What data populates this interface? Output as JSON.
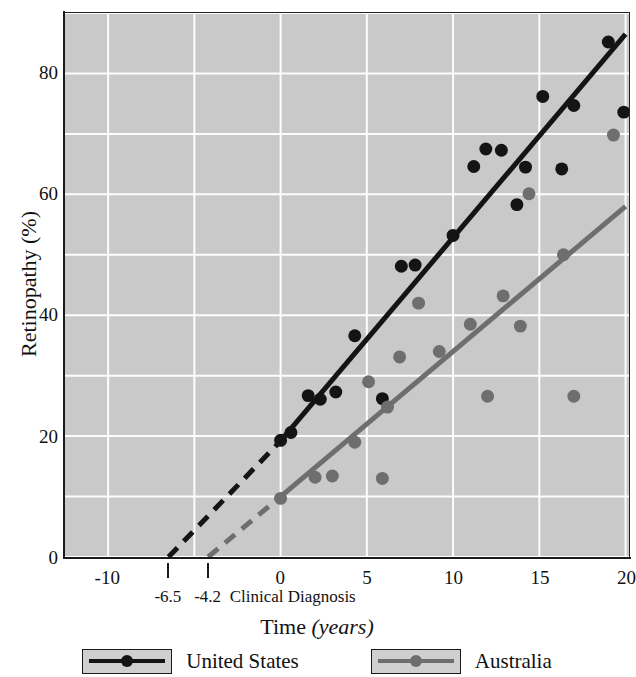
{
  "chart_data": {
    "type": "scatter",
    "title": "",
    "xlabel": "Time (years)",
    "xlabel_main": "Time",
    "xlabel_unit": "(years)",
    "ylabel": "Retinopathy (%)",
    "xlim": [
      -12.5,
      20.2
    ],
    "ylim": [
      0,
      90
    ],
    "grid": true,
    "grid_x_step": 5,
    "grid_y_step": 10,
    "plot_background": "#c9c9c9",
    "x_ticks": [
      -10,
      0,
      5,
      10,
      15,
      20
    ],
    "x_tick_labels": [
      "-10",
      "0",
      "5",
      "10",
      "15",
      "20"
    ],
    "y_ticks": [
      0,
      20,
      40,
      60,
      80
    ],
    "y_tick_labels": [
      "0",
      "20",
      "40",
      "60",
      "80"
    ],
    "annotation_ticks": [
      {
        "value": -6.5,
        "label": "-6.5"
      },
      {
        "value": -4.2,
        "label": "-4.2"
      }
    ],
    "annotation_text": "Clinical Diagnosis",
    "legend_position": "bottom",
    "series": [
      {
        "name": "United States",
        "color": "#141414",
        "marker": "circle",
        "line": {
          "solid_from": {
            "x": 0,
            "y": 19.2
          },
          "solid_to": {
            "x": 20,
            "y": 86.5
          },
          "dashed_from": {
            "x": -6.5,
            "y": 0
          },
          "dashed_to": {
            "x": 0,
            "y": 19.2
          },
          "x_intercept": -6.5
        },
        "points": [
          {
            "x": 0.0,
            "y": 19.3
          },
          {
            "x": 0.6,
            "y": 20.6
          },
          {
            "x": 1.6,
            "y": 26.7
          },
          {
            "x": 2.3,
            "y": 26.1
          },
          {
            "x": 3.2,
            "y": 27.3
          },
          {
            "x": 4.3,
            "y": 36.6
          },
          {
            "x": 5.9,
            "y": 26.2
          },
          {
            "x": 7.0,
            "y": 48.1
          },
          {
            "x": 7.8,
            "y": 48.3
          },
          {
            "x": 10.0,
            "y": 53.2
          },
          {
            "x": 11.2,
            "y": 64.6
          },
          {
            "x": 11.9,
            "y": 67.5
          },
          {
            "x": 12.8,
            "y": 67.3
          },
          {
            "x": 13.7,
            "y": 58.3
          },
          {
            "x": 14.2,
            "y": 64.5
          },
          {
            "x": 15.2,
            "y": 76.2
          },
          {
            "x": 16.3,
            "y": 64.2
          },
          {
            "x": 17.0,
            "y": 74.7
          },
          {
            "x": 19.0,
            "y": 85.2
          },
          {
            "x": 19.9,
            "y": 73.6
          }
        ]
      },
      {
        "name": "Australia",
        "color": "#6e6e6e",
        "marker": "circle",
        "line": {
          "solid_from": {
            "x": 0,
            "y": 10.0
          },
          "solid_to": {
            "x": 20,
            "y": 58.0
          },
          "dashed_from": {
            "x": -4.2,
            "y": 0
          },
          "dashed_to": {
            "x": 0,
            "y": 10.0
          },
          "x_intercept": -4.2
        },
        "points": [
          {
            "x": 0.0,
            "y": 9.7
          },
          {
            "x": 2.0,
            "y": 13.2
          },
          {
            "x": 3.0,
            "y": 13.4
          },
          {
            "x": 4.3,
            "y": 19.0
          },
          {
            "x": 5.1,
            "y": 29.0
          },
          {
            "x": 5.9,
            "y": 13.0
          },
          {
            "x": 6.2,
            "y": 24.8
          },
          {
            "x": 6.9,
            "y": 33.1
          },
          {
            "x": 8.0,
            "y": 42.0
          },
          {
            "x": 9.2,
            "y": 34.0
          },
          {
            "x": 11.0,
            "y": 38.5
          },
          {
            "x": 12.0,
            "y": 26.6
          },
          {
            "x": 12.9,
            "y": 43.2
          },
          {
            "x": 13.9,
            "y": 38.2
          },
          {
            "x": 14.4,
            "y": 60.1
          },
          {
            "x": 16.4,
            "y": 50.0
          },
          {
            "x": 17.0,
            "y": 26.6
          },
          {
            "x": 19.3,
            "y": 69.8
          }
        ]
      }
    ]
  },
  "legend": {
    "items": [
      {
        "label": "United States",
        "color": "#141414"
      },
      {
        "label": "Australia",
        "color": "#6e6e6e"
      }
    ]
  }
}
